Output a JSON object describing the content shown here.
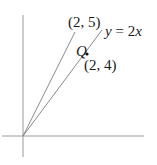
{
  "diagram": {
    "type": "coordinate-plane",
    "labels": {
      "point_upper": "(2, 5)",
      "line_equation_y": "y",
      "line_equation_rest": " = 2",
      "line_equation_x": "x",
      "point_q_name": "Q",
      "point_q_coords": "(2, 4)"
    },
    "lines": [
      {
        "name": "ray-to-2-5",
        "from": [
          0,
          0
        ],
        "to": [
          2,
          5
        ]
      },
      {
        "name": "line-y-equals-2x",
        "equation": "y = 2x"
      }
    ],
    "points": [
      {
        "name": "Q",
        "coords": [
          2,
          4
        ]
      }
    ],
    "colors": {
      "axis": "#9a9a9a",
      "line": "#8a8a8a",
      "text": "#1a1a1a",
      "point": "#111111"
    }
  }
}
